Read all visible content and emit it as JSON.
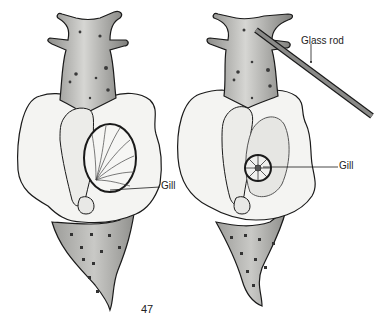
{
  "figure": {
    "page_number": "47",
    "colors": {
      "ink": "#1a1a1a",
      "body_fill": "#f4f4f2",
      "shade_dark": "#7a7a78",
      "shade_mid": "#b8b8b5",
      "spot": "#3a3a3a",
      "rod_fill": "#8a8a88"
    },
    "left_panel": {
      "description": "Sea slug (dorsal view) with mantle opened showing gill",
      "labels": [
        {
          "text": "Gill",
          "x": 161,
          "y": 178
        }
      ]
    },
    "right_panel": {
      "description": "Sea slug touched with glass rod; gill retracted",
      "labels": [
        {
          "text": "Glass rod",
          "x": 301,
          "y": 36
        },
        {
          "text": "Gill",
          "x": 339,
          "y": 158
        }
      ]
    }
  }
}
